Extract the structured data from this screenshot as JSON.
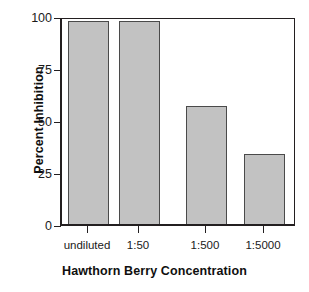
{
  "chart_data": {
    "type": "bar",
    "title": "",
    "subtitle": "",
    "xlabel": "Hawthorn Berry Concentration",
    "ylabel": "Percent Inhibition",
    "categories": [
      "undiluted",
      "1:50",
      "1:500",
      "1:5000"
    ],
    "values": [
      99,
      99,
      57.5,
      34
    ],
    "ylim": [
      0,
      100
    ],
    "yticks": [
      0,
      25,
      50,
      75,
      100
    ],
    "ytick_labels": [
      "0",
      "25",
      "50",
      "75",
      "100"
    ],
    "grid": false,
    "legend": null,
    "legend_position": "none",
    "annotations": [],
    "bar_color": "#c2c2c2",
    "bar_edge_color": "#4a4a4a",
    "axis_color": "#231f20",
    "background_color": "#ffffff"
  }
}
